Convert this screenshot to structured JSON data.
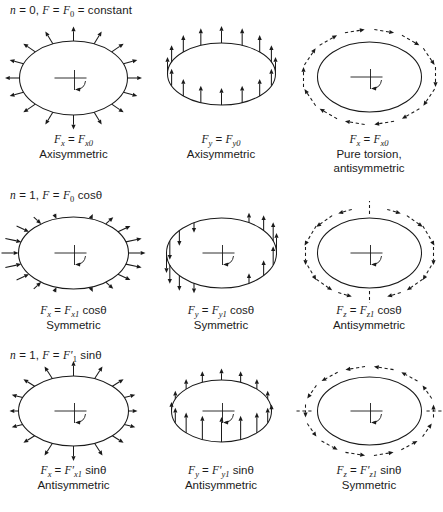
{
  "page_title": "Harmonic load components on a ring (n = 0 and n = 1)",
  "ink_color": "#1a1a1a",
  "background_color": "#ffffff",
  "rows": [
    {
      "header": [
        [
          "i",
          "n"
        ],
        [
          "n",
          " = 0, "
        ],
        [
          "i",
          "F"
        ],
        [
          "n",
          " = "
        ],
        [
          "i",
          "F"
        ],
        [
          "sub",
          "0"
        ],
        [
          "n",
          " = constant"
        ]
      ],
      "cells": [
        {
          "pattern": "radial-uniform-outward",
          "crosshair": true,
          "axis_dashes": "none",
          "formula": [
            [
              "i",
              "F"
            ],
            [
              "sub",
              "x"
            ],
            [
              "n",
              " = "
            ],
            [
              "i",
              "F"
            ],
            [
              "sub",
              "x0"
            ]
          ],
          "symmetry": "Axisymmetric"
        },
        {
          "pattern": "axial-uniform-up",
          "crosshair": false,
          "axis_dashes": "none",
          "formula": [
            [
              "i",
              "F"
            ],
            [
              "sub",
              "y"
            ],
            [
              "n",
              " = "
            ],
            [
              "i",
              "F"
            ],
            [
              "sub",
              "y0"
            ]
          ],
          "symmetry": "Axisymmetric"
        },
        {
          "pattern": "torsion-clockwise",
          "crosshair": true,
          "axis_dashes": "none",
          "formula": [
            [
              "i",
              "F"
            ],
            [
              "sub",
              "x"
            ],
            [
              "n",
              " = "
            ],
            [
              "i",
              "F"
            ],
            [
              "sub",
              "x0"
            ]
          ],
          "symmetry": "Pure torsion,\nantisymmetric"
        }
      ]
    },
    {
      "header": [
        [
          "i",
          "n"
        ],
        [
          "n",
          " = 1, "
        ],
        [
          "i",
          "F"
        ],
        [
          "n",
          " = "
        ],
        [
          "i",
          "F"
        ],
        [
          "sub",
          "0"
        ],
        [
          "n",
          " cosθ"
        ]
      ],
      "cells": [
        {
          "pattern": "radial-cos",
          "crosshair": true,
          "axis_dashes": "none",
          "formula": [
            [
              "i",
              "F"
            ],
            [
              "sub",
              "x"
            ],
            [
              "n",
              " = "
            ],
            [
              "i",
              "F"
            ],
            [
              "sub",
              "x1"
            ],
            [
              "n",
              " cosθ"
            ]
          ],
          "symmetry": "Symmetric"
        },
        {
          "pattern": "axial-cos",
          "crosshair": true,
          "axis_dashes": "none",
          "formula": [
            [
              "i",
              "F"
            ],
            [
              "sub",
              "y"
            ],
            [
              "n",
              " = "
            ],
            [
              "i",
              "F"
            ],
            [
              "sub",
              "y1"
            ],
            [
              "n",
              " cosθ"
            ]
          ],
          "symmetry": "Symmetric"
        },
        {
          "pattern": "torsion-cos",
          "crosshair": true,
          "axis_dashes": "vertical",
          "formula": [
            [
              "i",
              "F"
            ],
            [
              "sub",
              "z"
            ],
            [
              "n",
              " = "
            ],
            [
              "i",
              "F"
            ],
            [
              "sub",
              "z1"
            ],
            [
              "n",
              " cosθ"
            ]
          ],
          "symmetry": "Antisymmetric"
        }
      ]
    },
    {
      "header": [
        [
          "i",
          "n"
        ],
        [
          "n",
          " = 1, "
        ],
        [
          "i",
          "F"
        ],
        [
          "n",
          " = "
        ],
        [
          "i",
          "F′"
        ],
        [
          "sub",
          "1"
        ],
        [
          "n",
          " sinθ"
        ]
      ],
      "cells": [
        {
          "pattern": "radial-sin",
          "crosshair": true,
          "axis_dashes": "none",
          "formula": [
            [
              "i",
              "F"
            ],
            [
              "sub",
              "x"
            ],
            [
              "n",
              " = "
            ],
            [
              "i",
              "F′"
            ],
            [
              "sub",
              "x1"
            ],
            [
              "n",
              " sinθ"
            ]
          ],
          "symmetry": "Antisymmetric"
        },
        {
          "pattern": "axial-sin-up",
          "crosshair": true,
          "axis_dashes": "none",
          "formula": [
            [
              "i",
              "F"
            ],
            [
              "sub",
              "y"
            ],
            [
              "n",
              " = "
            ],
            [
              "i",
              "F′"
            ],
            [
              "sub",
              "y1"
            ],
            [
              "n",
              " sinθ"
            ]
          ],
          "symmetry": "Antisymmetric"
        },
        {
          "pattern": "torsion-ccw-sin",
          "crosshair": true,
          "axis_dashes": "horizontal",
          "formula": [
            [
              "i",
              "F"
            ],
            [
              "sub",
              "z"
            ],
            [
              "n",
              " = "
            ],
            [
              "i",
              "F′"
            ],
            [
              "sub",
              "z1"
            ],
            [
              "n",
              " sinθ"
            ]
          ],
          "symmetry": "Symmetric"
        }
      ]
    }
  ]
}
